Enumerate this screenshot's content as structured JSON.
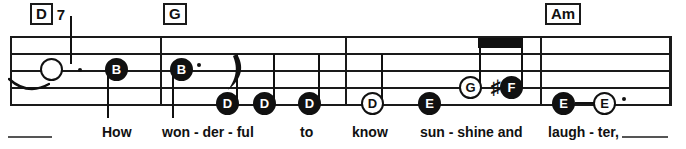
{
  "page": {
    "width": 686,
    "height": 149,
    "background": "#ffffff",
    "ink": "#111111"
  },
  "staff": {
    "left": 10,
    "right": 672,
    "line_ys": [
      36,
      53,
      70,
      87,
      104
    ],
    "line_count": 5,
    "barline_xs": [
      10,
      160,
      345,
      540,
      671
    ]
  },
  "chords": [
    {
      "name": "chord-D7",
      "root": "D",
      "extension": "7",
      "x": 30,
      "y": 3
    },
    {
      "name": "chord-G",
      "root": "G",
      "extension": "",
      "x": 163,
      "y": 3
    },
    {
      "name": "chord-Am",
      "root": "Am",
      "extension": "",
      "x": 545,
      "y": 3
    }
  ],
  "notes": [
    {
      "name": "note-1",
      "label": "",
      "style": "hollow-blank",
      "x": 50,
      "y": 70,
      "dotted": true,
      "stem": "up",
      "tied_from_previous": true
    },
    {
      "name": "note-2",
      "label": "B",
      "style": "filled",
      "x": 115,
      "y": 70,
      "dotted": false,
      "stem": "down"
    },
    {
      "name": "note-3",
      "label": "B",
      "style": "filled",
      "x": 180,
      "y": 70,
      "dotted": true,
      "stem": "down"
    },
    {
      "name": "note-4",
      "label": "D",
      "style": "filled",
      "x": 226,
      "y": 104,
      "dotted": false,
      "stem": "up",
      "flag": true
    },
    {
      "name": "note-5",
      "label": "D",
      "style": "filled",
      "x": 263,
      "y": 104,
      "dotted": false,
      "stem": "up"
    },
    {
      "name": "note-6",
      "label": "D",
      "style": "filled",
      "x": 308,
      "y": 104,
      "dotted": false,
      "stem": "up"
    },
    {
      "name": "note-7",
      "label": "D",
      "style": "hollow",
      "x": 371,
      "y": 104,
      "dotted": false,
      "stem": "up"
    },
    {
      "name": "note-8",
      "label": "E",
      "style": "filled",
      "x": 428,
      "y": 104,
      "dotted": false,
      "stem": "none"
    },
    {
      "name": "note-9",
      "label": "G",
      "style": "hollow",
      "x": 472,
      "y": 87,
      "dotted": false,
      "stem": "up",
      "beamed": true
    },
    {
      "name": "note-10",
      "label": "F",
      "style": "filled",
      "x": 511,
      "y": 87,
      "dotted": false,
      "stem": "up",
      "beamed": true,
      "accidental": "sharp"
    },
    {
      "name": "note-11",
      "label": "E",
      "style": "filled",
      "x": 562,
      "y": 104,
      "dotted": false,
      "stem": "none",
      "tied_to_next": true
    },
    {
      "name": "note-12",
      "label": "E",
      "style": "hollow",
      "x": 603,
      "y": 104,
      "dotted": true,
      "stem": "none"
    }
  ],
  "beam": {
    "x": 478,
    "y": 38,
    "width": 45,
    "height": 10
  },
  "lyrics": [
    {
      "name": "lyric-how",
      "text": "How",
      "x": 102
    },
    {
      "name": "lyric-won",
      "text": "won - der - ful",
      "x": 162
    },
    {
      "name": "lyric-to",
      "text": "to",
      "x": 300
    },
    {
      "name": "lyric-know",
      "text": "know",
      "x": 352
    },
    {
      "name": "lyric-sunshine",
      "text": "sun - shine and",
      "x": 420
    },
    {
      "name": "lyric-laughter",
      "text": "laugh - ter,",
      "x": 548
    }
  ],
  "lyric_rules": [
    {
      "name": "lyric-rule-start",
      "x": 8,
      "y": 136,
      "width": 44
    },
    {
      "name": "lyric-rule-end",
      "x": 622,
      "y": 136,
      "width": 46
    }
  ],
  "lyric_baseline_y": 124
}
